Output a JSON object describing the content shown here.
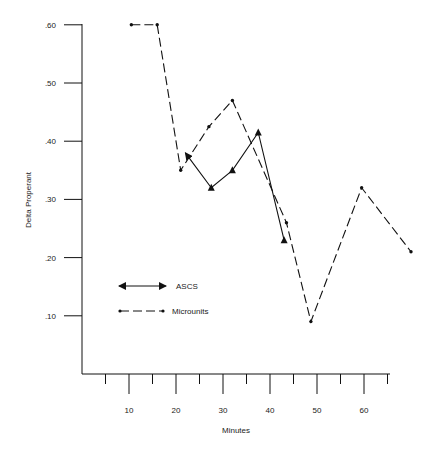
{
  "chart_data": {
    "type": "line",
    "title": "",
    "xlabel": "Minutes",
    "ylabel": "Delta Properant",
    "xlim": [
      0,
      66
    ],
    "ylim": [
      0,
      0.62
    ],
    "grid": false,
    "legend_position": "lower-left inside plot",
    "x_ticks_major": [
      10,
      20,
      30,
      40,
      50,
      60
    ],
    "x_tick_labels": [
      "10",
      "20",
      "30",
      "40",
      "50",
      "60"
    ],
    "x_ticks_minor": [
      5,
      15,
      25,
      35,
      45,
      55,
      65
    ],
    "y_ticks": [
      0.1,
      0.2,
      0.3,
      0.4,
      0.5,
      0.6
    ],
    "y_tick_labels": [
      ".10",
      ".20",
      ".30",
      ".40",
      ".50",
      ".60"
    ],
    "series": [
      {
        "name": "ASCS",
        "style": "solid line, triangle markers, arrowheads at ends",
        "points": [
          {
            "x": 22,
            "y": 0.38
          },
          {
            "x": 27.5,
            "y": 0.32
          },
          {
            "x": 32,
            "y": 0.35
          },
          {
            "x": 37.5,
            "y": 0.415
          },
          {
            "x": 43,
            "y": 0.23
          }
        ]
      },
      {
        "name": "Microunits",
        "style": "dashed line, dot markers",
        "points": [
          {
            "x": 10.5,
            "y": 0.6
          },
          {
            "x": 16,
            "y": 0.6
          },
          {
            "x": 21,
            "y": 0.35
          },
          {
            "x": 27,
            "y": 0.425
          },
          {
            "x": 32,
            "y": 0.47
          },
          {
            "x": 43.5,
            "y": 0.26
          },
          {
            "x": 48.7,
            "y": 0.09
          },
          {
            "x": 59.5,
            "y": 0.32
          },
          {
            "x": 70,
            "y": 0.21
          }
        ]
      }
    ]
  },
  "legend": {
    "items": [
      {
        "label": "ASCS"
      },
      {
        "label": "Microunits"
      }
    ]
  },
  "axes": {
    "xlabel": "Minutes",
    "ylabel": "Delta Properant"
  }
}
